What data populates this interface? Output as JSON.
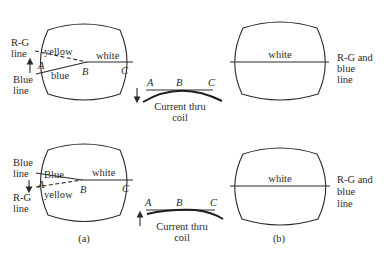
{
  "figure": {
    "panel_a_label": "(a)",
    "panel_b_label": "(b)",
    "top_row": {
      "left_screen": {
        "side_label_top_line1": "R-G",
        "side_label_top_line2": "line",
        "side_label_bottom_line1": "Blue",
        "side_label_bottom_line2": "line",
        "arrow_direction": "up",
        "upper_line_label": "yellow",
        "lower_line_label": "blue",
        "center_line_label": "white",
        "point_a": "A",
        "point_b": "B",
        "point_c": "C"
      },
      "coil": {
        "point_a": "A",
        "point_b": "B",
        "point_c": "C",
        "arrow_direction": "down",
        "caption_line1": "Current thru",
        "caption_line2": "coil"
      },
      "right_screen": {
        "center_line_label": "white",
        "side_label_line1": "R-G and",
        "side_label_line2": "blue",
        "side_label_line3": "line"
      }
    },
    "bottom_row": {
      "left_screen": {
        "side_label_top_line1": "Blue",
        "side_label_top_line2": "line",
        "side_label_bottom_line1": "R-G",
        "side_label_bottom_line2": "line",
        "arrow_direction": "down",
        "upper_line_label": "Blue",
        "lower_line_label": "yellow",
        "center_line_label": "white",
        "point_a": "A",
        "point_b": "B",
        "point_c": "C"
      },
      "coil": {
        "point_a": "A",
        "point_b": "B",
        "point_c": "C",
        "arrow_direction": "up",
        "caption_line1": "Current thru",
        "caption_line2": "coil"
      },
      "right_screen": {
        "center_line_label": "white",
        "side_label_line1": "R-G and",
        "side_label_line2": "blue",
        "side_label_line3": "line"
      }
    }
  }
}
